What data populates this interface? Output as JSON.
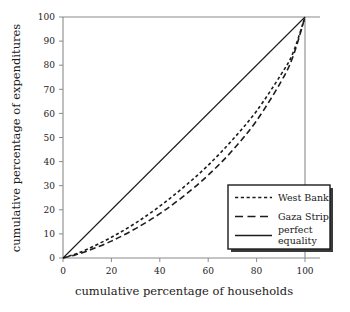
{
  "chart_data": {
    "type": "line",
    "title": "",
    "xlabel": "cumulative percentage of households",
    "ylabel": "cumulative percentage of expenditures",
    "xlim": [
      0,
      100
    ],
    "ylim": [
      0,
      100
    ],
    "xticks": [
      0,
      20,
      40,
      60,
      80,
      100
    ],
    "yticks": [
      0,
      10,
      20,
      30,
      40,
      50,
      60,
      70,
      80,
      90,
      100
    ],
    "grid": false,
    "legend_position": "lower right",
    "series": [
      {
        "name": "West Bank",
        "style": "dashed-short",
        "x": [
          0,
          5,
          10,
          20,
          30,
          40,
          50,
          60,
          70,
          80,
          90,
          95,
          100
        ],
        "values": [
          0,
          1.6,
          3.6,
          8.6,
          14.5,
          21.5,
          29.5,
          38.5,
          49,
          61,
          76,
          85,
          100
        ]
      },
      {
        "name": "Gaza Strip",
        "style": "dashed-long",
        "x": [
          0,
          5,
          10,
          20,
          30,
          40,
          50,
          60,
          70,
          80,
          90,
          95,
          100
        ],
        "values": [
          0,
          1.3,
          2.9,
          7.0,
          12.2,
          18.4,
          25.8,
          34.4,
          44.6,
          57,
          73,
          83.5,
          100
        ]
      },
      {
        "name": "perfect equality",
        "style": "solid",
        "x": [
          0,
          100
        ],
        "values": [
          0,
          100
        ]
      }
    ]
  },
  "axes": {
    "x_caption": "cumulative percentage of households",
    "y_caption": "cumulative percentage of expenditures",
    "x_tick_labels": [
      "0",
      "20",
      "40",
      "60",
      "80",
      "100"
    ],
    "y_tick_labels": [
      "0",
      "10",
      "20",
      "30",
      "40",
      "50",
      "60",
      "70",
      "80",
      "90",
      "100"
    ]
  },
  "legend": {
    "entries": [
      {
        "label": "West Bank"
      },
      {
        "label": "Gaza Strip"
      },
      {
        "label": "perfect"
      },
      {
        "label": "equality"
      }
    ]
  },
  "colors": {
    "line": "#1c1c1c",
    "axis": "#8a8a8a",
    "background": "#ffffff"
  }
}
